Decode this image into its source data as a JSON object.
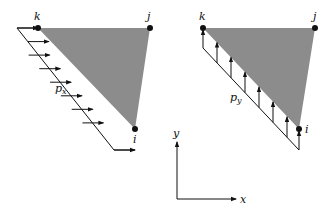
{
  "diagram": {
    "left_panel": {
      "nodes": {
        "k": "k",
        "j": "j",
        "i": "i"
      },
      "load_label": "p",
      "load_subscript": "x",
      "load_direction": "horizontal (+x)",
      "arrow_count": 9
    },
    "right_panel": {
      "nodes": {
        "k": "k",
        "j": "j",
        "i": "i"
      },
      "load_label": "p",
      "load_subscript": "y",
      "load_direction": "vertical (+y)",
      "arrow_count": 7
    },
    "axes": {
      "x_label": "x",
      "y_label": "y"
    },
    "colors": {
      "triangle_fill": "#8c8c8c",
      "line": "#111111",
      "background": "#ffffff"
    }
  }
}
